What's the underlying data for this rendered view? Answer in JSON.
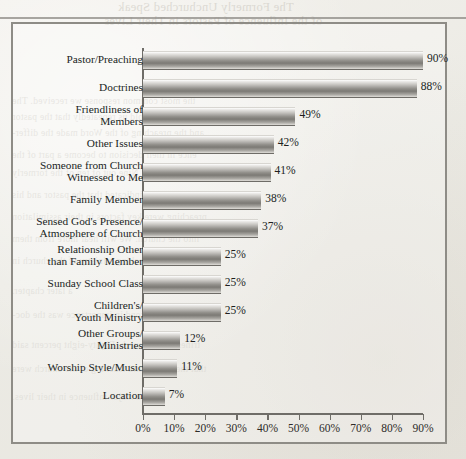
{
  "page": {
    "background_color": "#eeece7",
    "frame_border_color": "#8e8c86",
    "bleed_through_text": {
      "title_line_1": "The Formerly Unchurched Speak",
      "title_line_2": "of the Influence of Pastors in Their Lives",
      "body_lines": [
        "the most common response we received. The",
        "unchurched told us repeatedly that the pastor",
        "and the preaching of the Word made the differ-",
        "ence in their decision to become a part of the",
        "church. Nine out of ten of the formerly",
        "unchurched indicated that the pastor and his",
        "preaching were key factors in their assimilation",
        "into the church. We will hear more from them",
        "about the preaching ministry of the church in",
        "a later chapter.",
        "A close second in importance was the doc-",
        "trines of the church. Eighty-eight percent said",
        "that the beliefs and teaching of the church were",
        "a major influence in their lives."
      ]
    }
  },
  "chart_data": {
    "type": "bar",
    "orientation": "horizontal",
    "title": "",
    "subtitle": "",
    "xlabel": "",
    "ylabel": "",
    "xlim": [
      0,
      90
    ],
    "x_ticks": [
      0,
      10,
      20,
      30,
      40,
      50,
      60,
      70,
      80,
      90
    ],
    "x_tick_labels": [
      "0%",
      "10%",
      "20%",
      "30%",
      "40%",
      "50%",
      "60%",
      "70%",
      "80%",
      "90%"
    ],
    "grid": false,
    "legend": false,
    "legend_position": "none",
    "value_label_suffix": "%",
    "bar_fill_description": "vertical grayscale gradient, light top to dark center",
    "categories": [
      "Pastor/Preaching",
      "Doctrines",
      "Friendliness of\nMembers",
      "Other Issues",
      "Someone from Church\nWitnessed to Me",
      "Family Member",
      "Sensed God's Presence/\nAtmosphere of Church",
      "Relationship Other\nthan Family Member",
      "Sunday School Class",
      "Children's/\nYouth Ministry",
      "Other Groups/\nMinistries",
      "Worship Style/Music",
      "Location"
    ],
    "values": [
      90,
      88,
      49,
      42,
      41,
      38,
      37,
      25,
      25,
      25,
      12,
      11,
      7
    ],
    "value_labels": [
      "90%",
      "88%",
      "49%",
      "42%",
      "41%",
      "38%",
      "37%",
      "25%",
      "25%",
      "25%",
      "12%",
      "11%",
      "7%"
    ],
    "bars": [
      {
        "category_lines": [
          "Pastor/Preaching"
        ],
        "value": 90,
        "value_label": "90%"
      },
      {
        "category_lines": [
          "Doctrines"
        ],
        "value": 88,
        "value_label": "88%"
      },
      {
        "category_lines": [
          "Friendliness of",
          "Members"
        ],
        "value": 49,
        "value_label": "49%"
      },
      {
        "category_lines": [
          "Other Issues"
        ],
        "value": 42,
        "value_label": "42%"
      },
      {
        "category_lines": [
          "Someone from Church",
          "Witnessed to Me"
        ],
        "value": 41,
        "value_label": "41%"
      },
      {
        "category_lines": [
          "Family Member"
        ],
        "value": 38,
        "value_label": "38%"
      },
      {
        "category_lines": [
          "Sensed God's Presence/",
          "Atmosphere of Church"
        ],
        "value": 37,
        "value_label": "37%"
      },
      {
        "category_lines": [
          "Relationship Other",
          "than Family Member"
        ],
        "value": 25,
        "value_label": "25%"
      },
      {
        "category_lines": [
          "Sunday School Class"
        ],
        "value": 25,
        "value_label": "25%"
      },
      {
        "category_lines": [
          "Children's/",
          "Youth Ministry"
        ],
        "value": 25,
        "value_label": "25%"
      },
      {
        "category_lines": [
          "Other Groups/",
          "Ministries"
        ],
        "value": 12,
        "value_label": "12%"
      },
      {
        "category_lines": [
          "Worship Style/Music"
        ],
        "value": 11,
        "value_label": "11%"
      },
      {
        "category_lines": [
          "Location"
        ],
        "value": 7,
        "value_label": "7%"
      }
    ]
  }
}
